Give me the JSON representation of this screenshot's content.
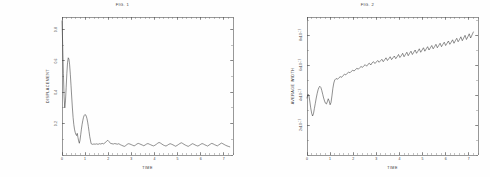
{
  "sheet": {
    "background": "#fefefe",
    "ink": "#2b2b2b",
    "panel_count": 2
  },
  "panels": [
    {
      "id": "fig-1",
      "title": "FIG. 1",
      "xlabel": "TIME",
      "ylabel": "DISPLACEMENT"
    },
    {
      "id": "fig-2",
      "title": "FIG. 2",
      "xlabel": "TIME",
      "ylabel": "AVERAGE WIDTH"
    }
  ],
  "chart_data": [
    {
      "type": "line",
      "title": "FIG. 1",
      "xlabel": "TIME",
      "ylabel": "DISPLACEMENT",
      "xlim": [
        0,
        7.4
      ],
      "ylim": [
        0,
        0.88
      ],
      "xticks": [
        0,
        1,
        2,
        3,
        4,
        5,
        6,
        7
      ],
      "xticklabels": [
        "0",
        "1",
        "2",
        "3",
        "4",
        "5",
        "6",
        "7"
      ],
      "yticks": [
        0.2,
        0.4,
        0.6,
        0.8
      ],
      "yticklabels": [
        "0.2",
        "0.4",
        "0.6",
        "0.8"
      ],
      "grid": false,
      "legend": false,
      "series": [
        {
          "name": "displacement",
          "color": "#2b2b2b",
          "x": [
            0.0,
            0.03,
            0.06,
            0.09,
            0.12,
            0.15,
            0.18,
            0.21,
            0.24,
            0.27,
            0.3,
            0.33,
            0.36,
            0.39,
            0.42,
            0.45,
            0.48,
            0.51,
            0.54,
            0.57,
            0.6,
            0.63,
            0.66,
            0.69,
            0.72,
            0.75,
            0.78,
            0.81,
            0.84,
            0.87,
            0.9,
            0.93,
            0.96,
            0.99,
            1.02,
            1.05,
            1.08,
            1.11,
            1.14,
            1.17,
            1.2,
            1.26,
            1.32,
            1.38,
            1.44,
            1.5,
            1.56,
            1.62,
            1.68,
            1.74,
            1.8,
            1.86,
            1.92,
            1.98,
            2.04,
            2.1,
            2.16,
            2.22,
            2.28,
            2.34,
            2.4,
            2.46,
            2.52,
            2.58,
            2.64,
            2.7,
            2.76,
            2.82,
            2.88,
            2.94,
            3.0,
            3.06,
            3.12,
            3.18,
            3.24,
            3.3,
            3.36,
            3.42,
            3.48,
            3.54,
            3.6,
            3.66,
            3.72,
            3.78,
            3.84,
            3.9,
            3.96,
            4.02,
            4.08,
            4.14,
            4.2,
            4.26,
            4.32,
            4.38,
            4.44,
            4.5,
            4.56,
            4.62,
            4.68,
            4.74,
            4.8,
            4.86,
            4.92,
            4.98,
            5.04,
            5.1,
            5.16,
            5.22,
            5.28,
            5.34,
            5.4,
            5.46,
            5.52,
            5.58,
            5.64,
            5.7,
            5.76,
            5.82,
            5.88,
            5.94,
            6.0,
            6.06,
            6.12,
            6.18,
            6.24,
            6.3,
            6.36,
            6.42,
            6.48,
            6.54,
            6.6,
            6.66,
            6.72,
            6.78,
            6.84,
            6.9,
            6.96,
            7.02,
            7.08,
            7.14,
            7.2,
            7.26,
            7.32
          ],
          "y": [
            0.855,
            0.7,
            0.52,
            0.375,
            0.3,
            0.345,
            0.43,
            0.52,
            0.59,
            0.62,
            0.612,
            0.575,
            0.515,
            0.445,
            0.37,
            0.3,
            0.24,
            0.195,
            0.165,
            0.145,
            0.132,
            0.124,
            0.138,
            0.112,
            0.09,
            0.075,
            0.095,
            0.13,
            0.165,
            0.195,
            0.22,
            0.24,
            0.252,
            0.258,
            0.256,
            0.248,
            0.232,
            0.21,
            0.182,
            0.15,
            0.118,
            0.072,
            0.068,
            0.07,
            0.069,
            0.071,
            0.068,
            0.072,
            0.07,
            0.074,
            0.071,
            0.078,
            0.086,
            0.094,
            0.085,
            0.074,
            0.072,
            0.07,
            0.073,
            0.071,
            0.069,
            0.072,
            0.066,
            0.062,
            0.058,
            0.055,
            0.06,
            0.068,
            0.072,
            0.07,
            0.066,
            0.062,
            0.058,
            0.063,
            0.07,
            0.074,
            0.071,
            0.067,
            0.063,
            0.059,
            0.064,
            0.07,
            0.073,
            0.069,
            0.065,
            0.061,
            0.058,
            0.062,
            0.068,
            0.075,
            0.08,
            0.076,
            0.07,
            0.064,
            0.06,
            0.057,
            0.062,
            0.068,
            0.072,
            0.069,
            0.065,
            0.06,
            0.056,
            0.061,
            0.067,
            0.073,
            0.078,
            0.074,
            0.068,
            0.063,
            0.059,
            0.055,
            0.06,
            0.066,
            0.072,
            0.069,
            0.064,
            0.06,
            0.057,
            0.062,
            0.068,
            0.073,
            0.07,
            0.065,
            0.061,
            0.057,
            0.063,
            0.069,
            0.074,
            0.071,
            0.066,
            0.062,
            0.058,
            0.064,
            0.07,
            0.076,
            0.072,
            0.067,
            0.062,
            0.058,
            0.055,
            0.052
          ]
        }
      ]
    },
    {
      "type": "line",
      "title": "FIG. 2",
      "xlabel": "TIME",
      "ylabel": "AVERAGE WIDTH",
      "xlim": [
        0,
        7.4
      ],
      "ylim": [
        0,
        9.2
      ],
      "xticks": [
        0,
        1,
        2,
        3,
        4,
        5,
        6,
        7
      ],
      "xticklabels": [
        "0",
        "1",
        "2",
        "3",
        "4",
        "5",
        "6",
        "7"
      ],
      "yticks": [
        2,
        4,
        6,
        8
      ],
      "yticklabels": [
        "2x10^-17",
        "4x10^-17",
        "6x10^-17",
        "8x10^-17"
      ],
      "y_unit": "1e-17",
      "grid": false,
      "legend": false,
      "series": [
        {
          "name": "average-width",
          "color": "#2b2b2b",
          "x": [
            0.0,
            0.04,
            0.08,
            0.12,
            0.16,
            0.2,
            0.24,
            0.28,
            0.32,
            0.36,
            0.4,
            0.44,
            0.48,
            0.52,
            0.56,
            0.6,
            0.64,
            0.68,
            0.72,
            0.76,
            0.8,
            0.84,
            0.88,
            0.92,
            0.96,
            1.0,
            1.04,
            1.08,
            1.12,
            1.16,
            1.2,
            1.26,
            1.32,
            1.38,
            1.44,
            1.5,
            1.56,
            1.62,
            1.68,
            1.74,
            1.8,
            1.86,
            1.92,
            1.98,
            2.04,
            2.1,
            2.16,
            2.22,
            2.28,
            2.34,
            2.4,
            2.46,
            2.52,
            2.58,
            2.64,
            2.7,
            2.76,
            2.82,
            2.88,
            2.94,
            3.0,
            3.06,
            3.12,
            3.18,
            3.24,
            3.3,
            3.36,
            3.42,
            3.48,
            3.54,
            3.6,
            3.66,
            3.72,
            3.78,
            3.84,
            3.9,
            3.96,
            4.02,
            4.08,
            4.14,
            4.2,
            4.26,
            4.32,
            4.38,
            4.44,
            4.5,
            4.56,
            4.62,
            4.68,
            4.74,
            4.8,
            4.86,
            4.92,
            4.98,
            5.04,
            5.1,
            5.16,
            5.22,
            5.28,
            5.34,
            5.4,
            5.46,
            5.52,
            5.58,
            5.64,
            5.7,
            5.76,
            5.82,
            5.88,
            5.94,
            6.0,
            6.06,
            6.12,
            6.18,
            6.24,
            6.3,
            6.36,
            6.42,
            6.48,
            6.54,
            6.6,
            6.66,
            6.72,
            6.78,
            6.84,
            6.9,
            6.96,
            7.02,
            7.08,
            7.14,
            7.2,
            7.26,
            7.32
          ],
          "y": [
            3.8,
            4.05,
            4.0,
            3.6,
            3.15,
            2.8,
            2.6,
            2.75,
            3.1,
            3.45,
            3.8,
            4.1,
            4.35,
            4.52,
            4.58,
            4.5,
            4.3,
            4.05,
            3.8,
            3.6,
            3.45,
            3.4,
            3.55,
            3.75,
            3.6,
            3.35,
            3.5,
            3.95,
            4.45,
            4.8,
            5.0,
            5.1,
            5.05,
            5.15,
            5.22,
            5.18,
            5.3,
            5.38,
            5.34,
            5.45,
            5.52,
            5.48,
            5.58,
            5.65,
            5.6,
            5.7,
            5.78,
            5.72,
            5.82,
            5.9,
            5.84,
            5.95,
            6.02,
            5.92,
            6.05,
            6.12,
            6.0,
            6.15,
            6.22,
            6.1,
            6.2,
            6.3,
            6.18,
            6.28,
            6.38,
            6.22,
            6.35,
            6.48,
            6.3,
            6.42,
            6.55,
            6.36,
            6.48,
            6.6,
            6.42,
            6.55,
            6.7,
            6.5,
            6.62,
            6.78,
            6.55,
            6.7,
            6.85,
            6.62,
            6.78,
            6.92,
            6.7,
            6.85,
            7.0,
            6.78,
            6.92,
            7.08,
            6.85,
            7.0,
            7.15,
            6.92,
            7.08,
            7.22,
            7.0,
            7.15,
            7.3,
            7.08,
            7.22,
            7.38,
            7.15,
            7.3,
            7.45,
            7.22,
            7.38,
            7.52,
            7.3,
            7.45,
            7.6,
            7.38,
            7.52,
            7.68,
            7.45,
            7.62,
            7.78,
            7.55,
            7.7,
            7.88,
            7.62,
            7.8,
            7.98,
            7.7,
            7.88,
            8.08,
            7.8,
            8.0,
            8.2
          ]
        }
      ]
    }
  ]
}
